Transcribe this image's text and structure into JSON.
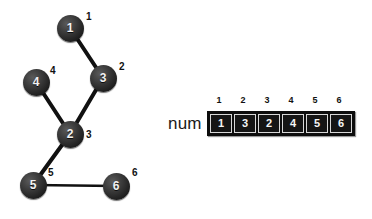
{
  "diagram": {
    "graph": {
      "nodes": [
        {
          "value": "1",
          "label": "1",
          "cx": 70,
          "cy": 28,
          "label_dx": 16,
          "label_dy": -16
        },
        {
          "value": "3",
          "label": "2",
          "cx": 103,
          "cy": 78,
          "label_dx": 16,
          "label_dy": -16
        },
        {
          "value": "4",
          "label": "4",
          "cx": 36,
          "cy": 82,
          "label_dx": 14,
          "label_dy": -16
        },
        {
          "value": "2",
          "label": "3",
          "cx": 70,
          "cy": 134,
          "label_dx": 16,
          "label_dy": -4
        },
        {
          "value": "5",
          "label": "5",
          "cx": 33,
          "cy": 185,
          "label_dx": 15,
          "label_dy": -17
        },
        {
          "value": "6",
          "label": "6",
          "cx": 116,
          "cy": 186,
          "label_dx": 16,
          "label_dy": -18
        }
      ],
      "edges": [
        {
          "from": 0,
          "to": 1,
          "thick": true
        },
        {
          "from": 2,
          "to": 3,
          "thick": true
        },
        {
          "from": 1,
          "to": 3,
          "thick": true
        },
        {
          "from": 3,
          "to": 4,
          "thick": true
        },
        {
          "from": 4,
          "to": 5,
          "thick": false
        }
      ],
      "edge_color": "#111111"
    },
    "array": {
      "name": "num",
      "indices": [
        "1",
        "2",
        "3",
        "4",
        "5",
        "6"
      ],
      "values": [
        "1",
        "3",
        "2",
        "4",
        "5",
        "6"
      ]
    },
    "colors": {
      "background": "#ffffff",
      "node_fill": "#1f1f1f",
      "node_text": "#f2f2f2",
      "label_text": "#111111",
      "array_frame": "#0d0d0d",
      "array_cell_text": "#f5f5f5"
    }
  }
}
